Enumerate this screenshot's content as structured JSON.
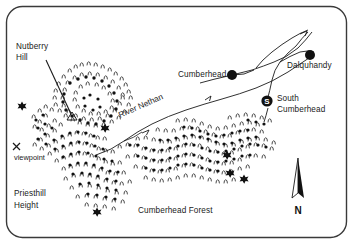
{
  "figure": {
    "kind": "location-map",
    "border_color": "#3a3a3a",
    "background_color": "#ffffff",
    "ink_color": "#1a1a1a",
    "width": 353,
    "height": 245
  },
  "labels": {
    "nutberry_hill": "Nutberry\nHill",
    "nutberry_hill_line1": "Nutberry",
    "nutberry_hill_line2": "Hill",
    "river_nethan": "River Nethan",
    "cumberhead": "Cumberhead",
    "dalquhandy": "Dalquhandy",
    "south_cumberhead_line1": "South",
    "south_cumberhead_line2": "Cumberhead",
    "viewpoint_marker": "x",
    "viewpoint": "viewpoint",
    "priesthill_height_line1": "Priesthill",
    "priesthill_height_line2": "Height",
    "cumberhead_forest": "Cumberhead Forest",
    "compass_north": "N",
    "south_cumberhead_symbol": "S"
  },
  "features": {
    "settlements": [
      {
        "name": "Cumberhead",
        "symbol": "filled-circle",
        "x": 232,
        "y": 75
      },
      {
        "name": "Dalquhandy",
        "symbol": "filled-circle",
        "x": 310,
        "y": 55
      },
      {
        "name": "South Cumberhead",
        "symbol": "lettered-circle",
        "letter": "S",
        "x": 267,
        "y": 101
      }
    ],
    "summit": {
      "name": "Nutberry Hill",
      "symbol": "triangle",
      "x": 72,
      "y": 117
    },
    "viewpoint": {
      "name": "viewpoint",
      "symbol": "x-cross",
      "x": 16,
      "y": 146
    },
    "compass": {
      "symbol": "north-arrow",
      "letter": "N",
      "x": 298,
      "y": 165
    },
    "star_markers": [
      {
        "x": 22,
        "y": 106
      },
      {
        "x": 104,
        "y": 128
      },
      {
        "x": 227,
        "y": 155
      },
      {
        "x": 97,
        "y": 212
      },
      {
        "x": 229,
        "y": 172
      },
      {
        "x": 243,
        "y": 178
      }
    ],
    "water": {
      "name": "River Nethan",
      "style": "thin-meandering-line"
    },
    "forest": {
      "name": "Cumberhead Forest",
      "style": "stippled-tree-symbols"
    }
  },
  "legend_notes": {
    "tree_symbol": "tree-symbol",
    "dot_symbol": "dot-symbol",
    "star_symbol": "star-symbol"
  }
}
